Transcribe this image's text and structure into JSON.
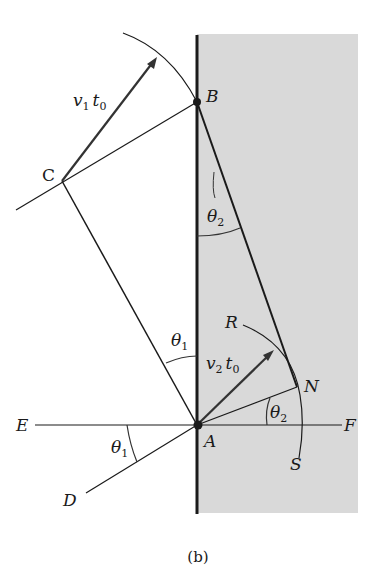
{
  "figure": {
    "caption": "(b)",
    "colors": {
      "medium_fill": "#d9d9d9",
      "line": "#1a1a1a"
    },
    "points": {
      "A": "A",
      "B": "B",
      "C": "C",
      "D": "D",
      "E": "E",
      "F": "F",
      "N": "N",
      "R": "R",
      "S": "S"
    },
    "vectors": {
      "v1t0": {
        "v": "v",
        "sub1": "1",
        "t": "t",
        "sub2": "0"
      },
      "v2t0": {
        "v": "v",
        "sub1": "2",
        "t": "t",
        "sub2": "0"
      }
    },
    "angles": {
      "theta1_top": {
        "sym": "θ",
        "sub": "1"
      },
      "theta1_bottom": {
        "sym": "θ",
        "sub": "1"
      },
      "theta2_top": {
        "sym": "θ",
        "sub": "2"
      },
      "theta2_bottom": {
        "sym": "θ",
        "sub": "2"
      }
    }
  }
}
